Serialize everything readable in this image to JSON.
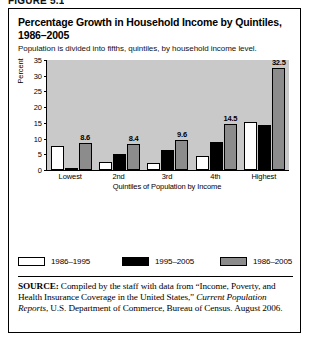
{
  "figure_number": "FIGURE 5.1",
  "panel": {
    "title": "Percentage Growth in Household Income by Quintiles, 1986–2005",
    "subtitle": "Population is divided into fifths, quintiles, by household income level."
  },
  "legend": {
    "entries": [
      {
        "label": "1986–1995",
        "color": "#ffffff",
        "swatch": "legend-swatch-white"
      },
      {
        "label": "1995–2005",
        "color": "#000000",
        "swatch": "legend-swatch-black"
      },
      {
        "label": "1986–2005",
        "color": "#8c8c8c",
        "swatch": "legend-swatch-gray"
      }
    ]
  },
  "source": {
    "label": "SOURCE:",
    "line1_rest": " Compiled by the staff with data from “Income,",
    "line2": "Poverty, and Health Insurance Coverage in the United States,”",
    "italic_title": "Current Population Reports",
    "line3_rest": ", U.S. Department of Commerce,",
    "line4": "Bureau of Census. August 2006."
  },
  "colors": {
    "plot_background": "#c9c9c9",
    "series_1986_1995": "#ffffff",
    "series_1995_2005": "#000000",
    "series_1986_2005": "#8c8c8c",
    "axis": "#000000",
    "panel_border": "#000000"
  },
  "chart_data": {
    "type": "bar",
    "title": "Percentage Growth in Household Income by Quintiles, 1986–2005",
    "subtitle": "Population is divided into fifths, quintiles, by household income level.",
    "xlabel": "Quintiles of Population by Income",
    "ylabel": "Percent",
    "categories": [
      "Lowest",
      "2nd",
      "3rd",
      "4th",
      "Highest"
    ],
    "ylim": [
      0,
      35
    ],
    "yticks": [
      0,
      5,
      10,
      15,
      20,
      25,
      30,
      35
    ],
    "grid": false,
    "legend_position": "below-plot",
    "series": [
      {
        "name": "1986–1995",
        "color": "#ffffff",
        "values": [
          7.7,
          2.5,
          2.3,
          4.5,
          15.2
        ],
        "labels": [
          "",
          "",
          "",
          "",
          ""
        ]
      },
      {
        "name": "1995–2005",
        "color": "#000000",
        "values": [
          0.2,
          5.1,
          6.3,
          8.8,
          14.2
        ],
        "labels": [
          "",
          "",
          "",
          "",
          ""
        ]
      },
      {
        "name": "1986–2005",
        "color": "#8c8c8c",
        "values": [
          8.6,
          8.4,
          9.6,
          14.5,
          32.5
        ],
        "labels": [
          "8.6",
          "8.4",
          "9.6",
          "14.5",
          "32.5"
        ]
      }
    ]
  }
}
